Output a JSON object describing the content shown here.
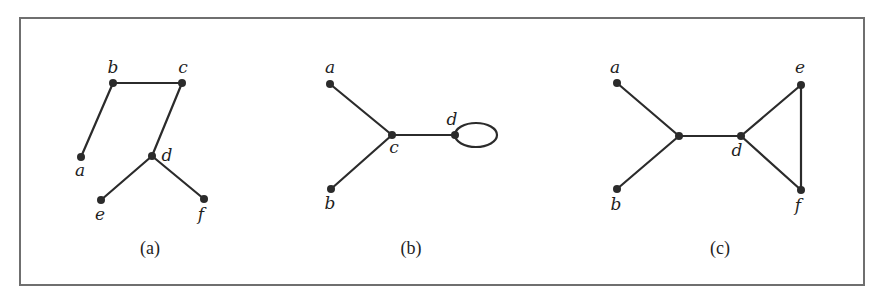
{
  "figure": {
    "frame": {
      "x": 20,
      "y": 18,
      "width": 844,
      "height": 267
    },
    "panels": [
      {
        "id": "a",
        "caption": "(a)",
        "caption_pos": [
          150,
          254
        ],
        "vertices": [
          {
            "id": "a",
            "label": "a",
            "x": 81,
            "y": 157,
            "lx": 80,
            "ly": 176
          },
          {
            "id": "b",
            "label": "b",
            "x": 113,
            "y": 83,
            "lx": 113,
            "ly": 73
          },
          {
            "id": "c",
            "label": "c",
            "x": 182,
            "y": 83,
            "lx": 183,
            "ly": 73
          },
          {
            "id": "d",
            "label": "d",
            "x": 152,
            "y": 156,
            "lx": 167,
            "ly": 161
          },
          {
            "id": "e",
            "label": "e",
            "x": 101,
            "y": 200,
            "lx": 100,
            "ly": 220
          },
          {
            "id": "f",
            "label": "f",
            "x": 204,
            "y": 199,
            "lx": 201,
            "ly": 220
          }
        ],
        "edges": [
          [
            "a",
            "b"
          ],
          [
            "b",
            "c"
          ],
          [
            "c",
            "d"
          ],
          [
            "d",
            "e"
          ],
          [
            "d",
            "f"
          ]
        ],
        "loops": []
      },
      {
        "id": "b",
        "caption": "(b)",
        "caption_pos": [
          411,
          254
        ],
        "vertices": [
          {
            "id": "a",
            "label": "a",
            "x": 330,
            "y": 84,
            "lx": 330,
            "ly": 73
          },
          {
            "id": "b",
            "label": "b",
            "x": 331,
            "y": 189,
            "lx": 330,
            "ly": 209
          },
          {
            "id": "c",
            "label": "c",
            "x": 392,
            "y": 135,
            "lx": 394,
            "ly": 153
          },
          {
            "id": "d",
            "label": "d",
            "x": 455,
            "y": 135,
            "lx": 452,
            "ly": 125
          }
        ],
        "edges": [
          [
            "a",
            "c"
          ],
          [
            "b",
            "c"
          ],
          [
            "c",
            "d"
          ]
        ],
        "loops": [
          {
            "at": "d",
            "rx": 21,
            "ry": 12
          }
        ]
      },
      {
        "id": "c",
        "caption": "(c)",
        "caption_pos": [
          720,
          254
        ],
        "vertices": [
          {
            "id": "a",
            "label": "a",
            "x": 617,
            "y": 83,
            "lx": 615,
            "ly": 73
          },
          {
            "id": "b",
            "label": "b",
            "x": 617,
            "y": 189,
            "lx": 616,
            "ly": 210
          },
          {
            "id": "m",
            "label": "",
            "x": 679,
            "y": 136,
            "lx": 0,
            "ly": 0
          },
          {
            "id": "d",
            "label": "d",
            "x": 741,
            "y": 136,
            "lx": 737,
            "ly": 156
          },
          {
            "id": "e",
            "label": "e",
            "x": 801,
            "y": 85,
            "lx": 800,
            "ly": 73
          },
          {
            "id": "f",
            "label": "f",
            "x": 801,
            "y": 190,
            "lx": 798,
            "ly": 211
          }
        ],
        "edges": [
          [
            "a",
            "m"
          ],
          [
            "b",
            "m"
          ],
          [
            "m",
            "d"
          ],
          [
            "d",
            "e"
          ],
          [
            "d",
            "f"
          ],
          [
            "e",
            "f"
          ]
        ],
        "loops": []
      }
    ]
  },
  "colors": {
    "ink": "#2b2b2b",
    "frame": "#6f6f6f",
    "background": "#ffffff"
  }
}
